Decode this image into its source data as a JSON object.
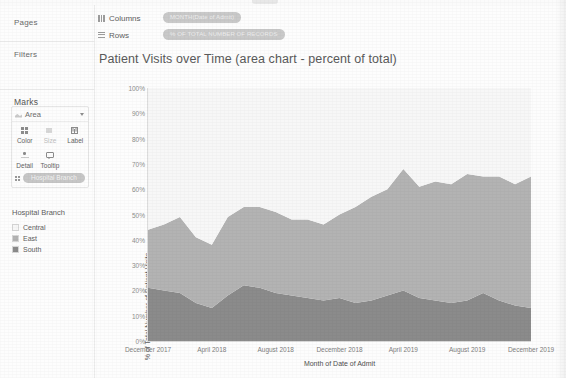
{
  "app": {
    "type": "tableau-worksheet"
  },
  "sidebar": {
    "pages_label": "Pages",
    "filters_label": "Filters",
    "marks_label": "Marks",
    "marks": {
      "type_label": "Area",
      "type_icon": "area-mark-icon",
      "buttons": [
        {
          "label": "Color",
          "icon": "color-icon",
          "enabled": true
        },
        {
          "label": "Size",
          "icon": "size-icon",
          "enabled": false
        },
        {
          "label": "Label",
          "icon": "label-icon",
          "enabled": true
        },
        {
          "label": "Detail",
          "icon": "detail-icon",
          "enabled": true
        },
        {
          "label": "Tooltip",
          "icon": "tooltip-icon",
          "enabled": true
        }
      ],
      "encoding_pill": "Hospital Branch"
    },
    "legend": {
      "title": "Hospital Branch",
      "items": [
        {
          "label": "Central",
          "color": "#f7f7f7"
        },
        {
          "label": "East",
          "color": "#b3b3b3"
        },
        {
          "label": "South",
          "color": "#8b8b8b"
        }
      ]
    }
  },
  "shelves": {
    "columns_label": "Columns",
    "rows_label": "Rows",
    "columns_pill": "MONTH(Date of Admit)",
    "rows_pill": "% OF TOTAL NUMBER OF RECORDS"
  },
  "chart_data": {
    "type": "area",
    "stacked": true,
    "percent_of_total": true,
    "title": "Patient Visits over Time (area chart - percent of total)",
    "xlabel": "Month of Date of Admit",
    "ylabel": "% of Total Number of Patient Visits",
    "ylim": [
      0,
      100
    ],
    "ytick_labels": [
      "0%",
      "10%",
      "20%",
      "30%",
      "40%",
      "50%",
      "60%",
      "70%",
      "80%",
      "90%",
      "100%"
    ],
    "ytick_values": [
      0,
      10,
      20,
      30,
      40,
      50,
      60,
      70,
      80,
      90,
      100
    ],
    "xtick_labels": [
      "December 2017",
      "April 2018",
      "August 2018",
      "December 2018",
      "April 2019",
      "August 2019",
      "December 2019"
    ],
    "xtick_positions": [
      0,
      4,
      8,
      12,
      16,
      20,
      24
    ],
    "grid": false,
    "legend_position": "left-sidebar",
    "x": [
      "December 2017",
      "January 2018",
      "February 2018",
      "March 2018",
      "April 2018",
      "May 2018",
      "June 2018",
      "July 2018",
      "August 2018",
      "September 2018",
      "October 2018",
      "November 2018",
      "December 2018",
      "January 2019",
      "February 2019",
      "March 2019",
      "April 2019",
      "May 2019",
      "June 2019",
      "July 2019",
      "August 2019",
      "September 2019",
      "October 2019",
      "November 2019",
      "December 2019"
    ],
    "series": [
      {
        "name": "South",
        "color": "#8b8b8b",
        "values": [
          21,
          20,
          19,
          15,
          13,
          18,
          22,
          21,
          19,
          18,
          17,
          16,
          17,
          15,
          16,
          18,
          20,
          17,
          16,
          15,
          16,
          19,
          16,
          14,
          13
        ]
      },
      {
        "name": "East",
        "color": "#b3b3b3",
        "values": [
          23,
          26,
          30,
          26,
          25,
          31,
          31,
          32,
          32,
          30,
          31,
          30,
          33,
          38,
          41,
          42,
          48,
          44,
          47,
          47,
          50,
          46,
          49,
          48,
          52
        ]
      },
      {
        "name": "Central",
        "color": "#f7f7f7",
        "values": [
          56,
          54,
          51,
          59,
          62,
          51,
          47,
          47,
          49,
          52,
          52,
          54,
          50,
          47,
          43,
          40,
          32,
          39,
          37,
          38,
          34,
          35,
          35,
          38,
          35
        ]
      }
    ],
    "cumulative_top_south": [
      21,
      20,
      19,
      15,
      13,
      18,
      22,
      21,
      19,
      18,
      17,
      16,
      17,
      15,
      16,
      18,
      20,
      17,
      16,
      15,
      16,
      19,
      16,
      14,
      13
    ],
    "cumulative_top_east": [
      44,
      46,
      49,
      41,
      38,
      49,
      53,
      53,
      51,
      48,
      48,
      46,
      50,
      53,
      57,
      60,
      68,
      61,
      63,
      62,
      66,
      65,
      65,
      62,
      65
    ]
  }
}
